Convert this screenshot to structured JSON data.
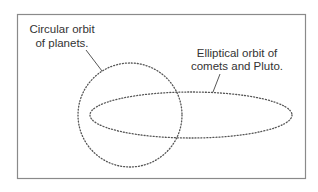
{
  "diagram": {
    "colors": {
      "frame": "#8a8a8a",
      "orbit": "#555555",
      "leader": "#444444",
      "text": "#333333",
      "background": "#ffffff"
    },
    "labels": {
      "circular": {
        "line1": "Circular orbit",
        "line2": "of planets."
      },
      "elliptical": {
        "line1": "Elliptical orbit of",
        "line2": "comets and Pluto."
      }
    },
    "shapes": {
      "circle_orbit": {
        "cx": 130,
        "cy": 115,
        "r": 52,
        "style": "dotted"
      },
      "ellipse_orbit": {
        "cx": 191,
        "cy": 115,
        "rx": 101,
        "ry": 23,
        "style": "dotted"
      }
    }
  }
}
